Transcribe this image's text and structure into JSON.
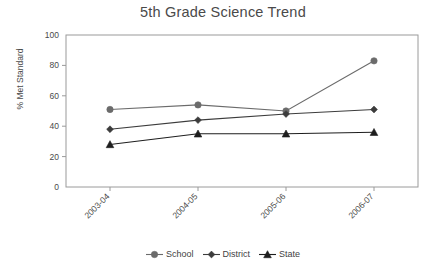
{
  "chart_data": {
    "type": "line",
    "title": "5th Grade Science Trend",
    "xlabel": "",
    "ylabel": "% Met Standard",
    "categories": [
      "2003-04",
      "2004-05",
      "2005-06",
      "2006-07"
    ],
    "ylim": [
      0,
      100
    ],
    "yticks": [
      0,
      20,
      40,
      60,
      80,
      100
    ],
    "grid": false,
    "legend_position": "bottom",
    "series": [
      {
        "name": "School",
        "values": [
          51,
          54,
          50,
          83
        ],
        "marker": "circle",
        "color": "#6b6b6b"
      },
      {
        "name": "District",
        "values": [
          38,
          44,
          48,
          51
        ],
        "marker": "diamond",
        "color": "#3c3c3c"
      },
      {
        "name": "State",
        "values": [
          28,
          35,
          35,
          36
        ],
        "marker": "triangle",
        "color": "#1e1e1e"
      }
    ]
  },
  "axis": {
    "y_labels": [
      "100",
      "80",
      "60",
      "40",
      "20",
      "0"
    ],
    "x_labels": [
      "2003-04",
      "2004-05",
      "2005-06",
      "2006-07"
    ]
  },
  "legend": {
    "items": [
      {
        "label": "School"
      },
      {
        "label": "District"
      },
      {
        "label": "State"
      }
    ]
  }
}
